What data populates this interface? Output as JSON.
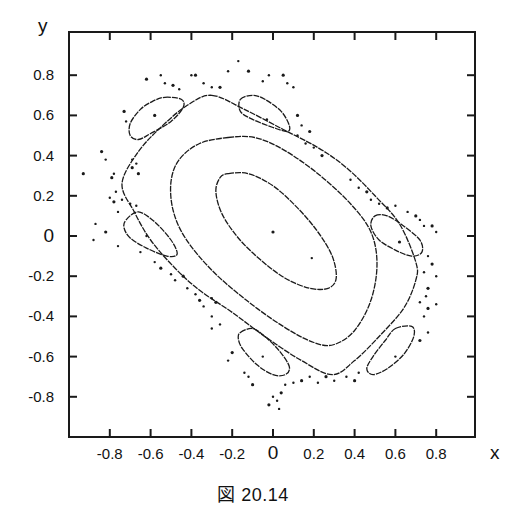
{
  "figure": {
    "caption": "図 20.14",
    "xlabel": "x",
    "ylabel": "y",
    "ink_color": "#1a1a1a",
    "background": "#ffffff"
  },
  "axes": {
    "xticks": [
      {
        "value": -0.8,
        "label": "-0.8"
      },
      {
        "value": -0.6,
        "label": "-0.6"
      },
      {
        "value": -0.4,
        "label": "-0.4"
      },
      {
        "value": -0.2,
        "label": "-0.2"
      },
      {
        "value": 0,
        "label": "0"
      },
      {
        "value": 0.2,
        "label": "0.2"
      },
      {
        "value": 0.4,
        "label": "0.4"
      },
      {
        "value": 0.6,
        "label": "0.6"
      },
      {
        "value": 0.8,
        "label": "0.8"
      }
    ],
    "yticks": [
      {
        "value": 0.8,
        "label": "0.8"
      },
      {
        "value": 0.6,
        "label": "0.6"
      },
      {
        "value": 0.4,
        "label": "0.4"
      },
      {
        "value": 0.2,
        "label": "0.2"
      },
      {
        "value": 0,
        "label": "0"
      },
      {
        "value": -0.2,
        "label": "-0.2"
      },
      {
        "value": -0.4,
        "label": "-0.4"
      },
      {
        "value": -0.6,
        "label": "-0.6"
      },
      {
        "value": -0.8,
        "label": "-0.8"
      }
    ]
  },
  "chart_data": {
    "type": "scatter",
    "title": "図 20.14",
    "xlabel": "x",
    "ylabel": "y",
    "xlim": [
      -1.0,
      1.0
    ],
    "ylim": [
      -1.0,
      0.98
    ],
    "grid": false,
    "legend": null,
    "series": [
      {
        "name": "central fixed point",
        "kind": "points",
        "points": [
          [
            0.0,
            0.02
          ],
          [
            0.19,
            -0.11
          ]
        ]
      },
      {
        "name": "inner invariant curve",
        "kind": "closed_curve",
        "points": [
          [
            -0.22,
            0.31
          ],
          [
            -0.12,
            0.31
          ],
          [
            0.0,
            0.25
          ],
          [
            0.12,
            0.14
          ],
          [
            0.22,
            0.02
          ],
          [
            0.29,
            -0.1
          ],
          [
            0.31,
            -0.21
          ],
          [
            0.27,
            -0.26
          ],
          [
            0.18,
            -0.26
          ],
          [
            0.06,
            -0.21
          ],
          [
            -0.06,
            -0.12
          ],
          [
            -0.17,
            -0.01
          ],
          [
            -0.25,
            0.11
          ],
          [
            -0.28,
            0.22
          ],
          [
            -0.26,
            0.29
          ]
        ]
      },
      {
        "name": "middle invariant curve",
        "kind": "closed_curve",
        "points": [
          [
            -0.22,
            0.49
          ],
          [
            -0.09,
            0.49
          ],
          [
            0.05,
            0.43
          ],
          [
            0.22,
            0.31
          ],
          [
            0.38,
            0.16
          ],
          [
            0.48,
            0.02
          ],
          [
            0.51,
            -0.14
          ],
          [
            0.48,
            -0.32
          ],
          [
            0.4,
            -0.47
          ],
          [
            0.3,
            -0.54
          ],
          [
            0.2,
            -0.53
          ],
          [
            0.05,
            -0.45
          ],
          [
            -0.13,
            -0.32
          ],
          [
            -0.3,
            -0.17
          ],
          [
            -0.43,
            -0.01
          ],
          [
            -0.49,
            0.13
          ],
          [
            -0.5,
            0.27
          ],
          [
            -0.46,
            0.38
          ],
          [
            -0.36,
            0.46
          ]
        ]
      },
      {
        "name": "outer invariant curve",
        "kind": "closed_curve",
        "points": [
          [
            -0.3,
            0.7
          ],
          [
            -0.14,
            0.63
          ],
          [
            0.05,
            0.53
          ],
          [
            0.22,
            0.44
          ],
          [
            0.36,
            0.34
          ],
          [
            0.5,
            0.2
          ],
          [
            0.62,
            0.06
          ],
          [
            0.7,
            -0.13
          ],
          [
            0.7,
            -0.22
          ],
          [
            0.64,
            -0.36
          ],
          [
            0.52,
            -0.5
          ],
          [
            0.4,
            -0.62
          ],
          [
            0.29,
            -0.69
          ],
          [
            0.14,
            -0.62
          ],
          [
            -0.04,
            -0.5
          ],
          [
            -0.2,
            -0.38
          ],
          [
            -0.36,
            -0.27
          ],
          [
            -0.48,
            -0.16
          ],
          [
            -0.6,
            -0.02
          ],
          [
            -0.68,
            0.12
          ],
          [
            -0.74,
            0.26
          ],
          [
            -0.66,
            0.42
          ],
          [
            -0.54,
            0.55
          ],
          [
            -0.42,
            0.65
          ]
        ]
      },
      {
        "name": "island top-left",
        "kind": "closed_curve",
        "points": [
          [
            -0.53,
            0.69
          ],
          [
            -0.45,
            0.68
          ],
          [
            -0.44,
            0.64
          ],
          [
            -0.5,
            0.57
          ],
          [
            -0.6,
            0.51
          ],
          [
            -0.66,
            0.48
          ],
          [
            -0.7,
            0.5
          ],
          [
            -0.7,
            0.56
          ],
          [
            -0.65,
            0.63
          ],
          [
            -0.59,
            0.67
          ]
        ]
      },
      {
        "name": "island top-center",
        "kind": "closed_curve",
        "points": [
          [
            -0.16,
            0.68
          ],
          [
            -0.1,
            0.7
          ],
          [
            -0.04,
            0.68
          ],
          [
            0.04,
            0.62
          ],
          [
            0.08,
            0.55
          ],
          [
            0.07,
            0.52
          ],
          [
            0.0,
            0.54
          ],
          [
            -0.1,
            0.58
          ],
          [
            -0.16,
            0.62
          ]
        ]
      },
      {
        "name": "island left",
        "kind": "closed_curve",
        "points": [
          [
            -0.72,
            0.08
          ],
          [
            -0.66,
            0.12
          ],
          [
            -0.58,
            0.07
          ],
          [
            -0.5,
            -0.02
          ],
          [
            -0.47,
            -0.09
          ],
          [
            -0.52,
            -0.1
          ],
          [
            -0.62,
            -0.06
          ],
          [
            -0.7,
            -0.01
          ],
          [
            -0.73,
            0.04
          ]
        ]
      },
      {
        "name": "island right",
        "kind": "closed_curve",
        "points": [
          [
            0.5,
            0.1
          ],
          [
            0.56,
            0.1
          ],
          [
            0.64,
            0.05
          ],
          [
            0.72,
            -0.02
          ],
          [
            0.73,
            -0.08
          ],
          [
            0.68,
            -0.1
          ],
          [
            0.6,
            -0.07
          ],
          [
            0.52,
            -0.02
          ],
          [
            0.48,
            0.05
          ]
        ]
      },
      {
        "name": "island bottom-center",
        "kind": "closed_curve",
        "points": [
          [
            -0.16,
            -0.48
          ],
          [
            -0.1,
            -0.46
          ],
          [
            -0.04,
            -0.5
          ],
          [
            0.03,
            -0.57
          ],
          [
            0.08,
            -0.65
          ],
          [
            0.06,
            -0.69
          ],
          [
            0.0,
            -0.69
          ],
          [
            -0.08,
            -0.64
          ],
          [
            -0.15,
            -0.56
          ],
          [
            -0.17,
            -0.51
          ]
        ]
      },
      {
        "name": "island bottom-right",
        "kind": "closed_curve",
        "points": [
          [
            0.6,
            -0.46
          ],
          [
            0.68,
            -0.45
          ],
          [
            0.69,
            -0.5
          ],
          [
            0.64,
            -0.59
          ],
          [
            0.56,
            -0.66
          ],
          [
            0.49,
            -0.69
          ],
          [
            0.46,
            -0.66
          ],
          [
            0.49,
            -0.6
          ],
          [
            0.55,
            -0.52
          ]
        ]
      },
      {
        "name": "island centers",
        "kind": "points",
        "points": [
          [
            -0.58,
            0.6
          ],
          [
            -0.03,
            0.58
          ],
          [
            -0.62,
            0.0
          ],
          [
            0.62,
            -0.03
          ],
          [
            -0.05,
            -0.6
          ],
          [
            0.6,
            -0.6
          ]
        ]
      },
      {
        "name": "chaotic scattered points",
        "kind": "points",
        "points": [
          [
            -0.93,
            0.31
          ],
          [
            -0.87,
            0.06
          ],
          [
            -0.88,
            -0.02
          ],
          [
            -0.84,
            0.42
          ],
          [
            -0.82,
            0.38
          ],
          [
            -0.78,
            0.31
          ],
          [
            -0.79,
            0.29
          ],
          [
            -0.77,
            0.22
          ],
          [
            -0.8,
            0.19
          ],
          [
            -0.78,
            0.17
          ],
          [
            -0.74,
            0.18
          ],
          [
            -0.76,
            0.12
          ],
          [
            -0.82,
            0.02
          ],
          [
            -0.76,
            -0.05
          ],
          [
            -0.72,
            0.57
          ],
          [
            -0.73,
            0.62
          ],
          [
            -0.69,
            0.38
          ],
          [
            -0.67,
            0.36
          ],
          [
            -0.66,
            0.31
          ],
          [
            -0.7,
            0.16
          ],
          [
            -0.67,
            0.15
          ],
          [
            -0.69,
            0.34
          ],
          [
            -0.65,
            -0.08
          ],
          [
            -0.58,
            -0.13
          ],
          [
            -0.55,
            -0.16
          ],
          [
            -0.5,
            -0.19
          ],
          [
            -0.48,
            -0.22
          ],
          [
            -0.44,
            -0.2
          ],
          [
            -0.42,
            -0.26
          ],
          [
            -0.38,
            -0.29
          ],
          [
            -0.36,
            -0.32
          ],
          [
            -0.34,
            -0.35
          ],
          [
            -0.3,
            -0.31
          ],
          [
            -0.28,
            -0.33
          ],
          [
            -0.3,
            -0.4
          ],
          [
            -0.26,
            -0.44
          ],
          [
            -0.62,
            0.78
          ],
          [
            -0.55,
            0.8
          ],
          [
            -0.53,
            0.76
          ],
          [
            -0.49,
            0.75
          ],
          [
            -0.46,
            0.73
          ],
          [
            -0.4,
            0.8
          ],
          [
            -0.38,
            0.8
          ],
          [
            -0.34,
            0.76
          ],
          [
            -0.3,
            0.74
          ],
          [
            -0.26,
            0.74
          ],
          [
            -0.22,
            0.82
          ],
          [
            -0.17,
            0.87
          ],
          [
            -0.12,
            0.82
          ],
          [
            -0.05,
            0.77
          ],
          [
            -0.02,
            0.8
          ],
          [
            0.05,
            0.8
          ],
          [
            0.07,
            0.76
          ],
          [
            0.1,
            0.74
          ],
          [
            0.12,
            0.6
          ],
          [
            0.14,
            0.55
          ],
          [
            0.12,
            0.5
          ],
          [
            0.18,
            0.52
          ],
          [
            0.16,
            0.46
          ],
          [
            0.2,
            0.44
          ],
          [
            0.24,
            0.4
          ],
          [
            0.38,
            0.28
          ],
          [
            0.42,
            0.24
          ],
          [
            0.46,
            0.22
          ],
          [
            0.48,
            0.18
          ],
          [
            0.52,
            0.16
          ],
          [
            0.56,
            0.14
          ],
          [
            0.6,
            0.15
          ],
          [
            0.66,
            0.12
          ],
          [
            0.7,
            0.1
          ],
          [
            0.72,
            0.08
          ],
          [
            0.74,
            0.05
          ],
          [
            0.78,
            0.05
          ],
          [
            0.8,
            0.02
          ],
          [
            0.76,
            -0.1
          ],
          [
            0.78,
            -0.14
          ],
          [
            0.74,
            -0.18
          ],
          [
            0.8,
            -0.2
          ],
          [
            0.76,
            -0.26
          ],
          [
            0.75,
            -0.3
          ],
          [
            0.72,
            -0.33
          ],
          [
            0.76,
            -0.36
          ],
          [
            0.8,
            -0.34
          ],
          [
            0.74,
            -0.4
          ],
          [
            0.72,
            -0.52
          ],
          [
            0.76,
            -0.48
          ],
          [
            0.42,
            -0.68
          ],
          [
            0.4,
            -0.72
          ],
          [
            0.36,
            -0.7
          ],
          [
            0.3,
            -0.72
          ],
          [
            0.26,
            -0.7
          ],
          [
            0.22,
            -0.73
          ],
          [
            0.18,
            -0.7
          ],
          [
            0.14,
            -0.72
          ],
          [
            0.1,
            -0.73
          ],
          [
            0.06,
            -0.74
          ],
          [
            0.04,
            -0.78
          ],
          [
            0.02,
            -0.82
          ],
          [
            0.0,
            -0.8
          ],
          [
            -0.02,
            -0.84
          ],
          [
            0.03,
            -0.86
          ],
          [
            -0.12,
            -0.7
          ],
          [
            -0.1,
            -0.74
          ],
          [
            -0.14,
            -0.68
          ],
          [
            -0.22,
            -0.62
          ],
          [
            -0.2,
            -0.58
          ],
          [
            -0.3,
            -0.46
          ]
        ]
      }
    ]
  }
}
